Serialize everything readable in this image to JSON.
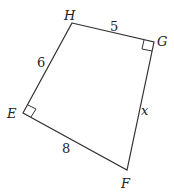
{
  "diagram": {
    "type": "quadrilateral",
    "vertices": [
      {
        "name": "H",
        "x": 72,
        "y": 23,
        "label_x": 69,
        "label_y": 19
      },
      {
        "name": "G",
        "x": 154,
        "y": 42,
        "label_x": 161,
        "label_y": 43
      },
      {
        "name": "F",
        "x": 127,
        "y": 170,
        "label_x": 126,
        "label_y": 187
      },
      {
        "name": "E",
        "x": 23,
        "y": 113,
        "label_x": 13,
        "label_y": 117
      }
    ],
    "sides": [
      {
        "from": "H",
        "to": "G",
        "label": "5",
        "label_x": 114,
        "label_y": 30
      },
      {
        "from": "G",
        "to": "F",
        "label": "x",
        "label_x": 145,
        "label_y": 114
      },
      {
        "from": "F",
        "to": "E",
        "label": "8",
        "label_x": 66,
        "label_y": 152
      },
      {
        "from": "E",
        "to": "H",
        "label": "6",
        "label_x": 41,
        "label_y": 66
      }
    ],
    "right_angles": [
      "G",
      "E"
    ],
    "stroke_color": "#333333",
    "text_color": "#222222"
  }
}
